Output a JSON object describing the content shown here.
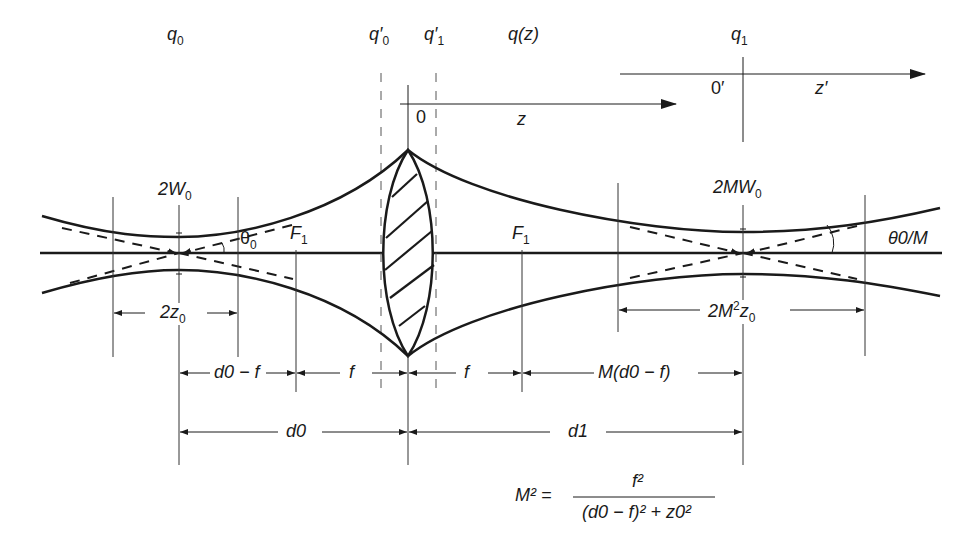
{
  "diagram": {
    "top_labels": {
      "q0": {
        "base": "q",
        "sub": "0"
      },
      "q0_prime": {
        "base": "q′",
        "sub": "0"
      },
      "q1_prime": {
        "base": "q′",
        "sub": "1"
      },
      "qz": "q(z)",
      "q1": {
        "base": "q",
        "sub": "1"
      }
    },
    "axes": {
      "origin": "0",
      "z": "z",
      "origin_prime": "0′",
      "z_prime": "z′"
    },
    "beam_labels": {
      "input_waist": {
        "base": "2W",
        "sub": "0"
      },
      "input_angle": {
        "base": "θ",
        "sub": "0"
      },
      "focal_left": {
        "base": "F",
        "sub": "1"
      },
      "focal_right": {
        "base": "F",
        "sub": "1"
      },
      "output_waist": {
        "base": "2MW",
        "sub": "0"
      },
      "output_angle": "θ0/M",
      "input_rayleigh": {
        "base": "2z",
        "sub": "0"
      },
      "output_rayleigh": {
        "base": "2M",
        "sup": "2",
        "tail": "z",
        "sub": "0"
      }
    },
    "dimensions": {
      "d0_minus_f": "d0 − f",
      "f_left": "f",
      "f_right": "f",
      "M_d0_minus_f": "M(d0 − f)",
      "d0": "d0",
      "d1": "d1"
    },
    "equation": {
      "lhs": "M²",
      "numerator": "f²",
      "denominator": "(d0 − f)² + z0²"
    },
    "colors": {
      "stroke": "#1a1a1a",
      "background": "#ffffff"
    }
  }
}
